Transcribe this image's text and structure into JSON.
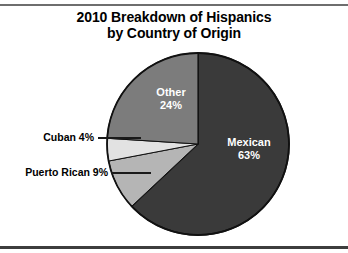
{
  "figure": {
    "title_line_1": "2010 Breakdown of Hispanics",
    "title_line_2": "by Country of Origin"
  },
  "chart_data": {
    "type": "pie",
    "title": "2010 Breakdown of Hispanics by Country of Origin",
    "xlabel": "",
    "ylabel": "",
    "legend_position": "none",
    "grid": false,
    "start_angle_deg": 0,
    "direction": "clockwise",
    "categories": [
      "Mexican",
      "Puerto Rican",
      "Cuban",
      "Other"
    ],
    "values": [
      63,
      9,
      4,
      24
    ],
    "unit": "%",
    "slices": [
      {
        "name": "Mexican",
        "label": "Mexican",
        "percent": 63,
        "percent_text": "63%",
        "color": "#3a3a3a",
        "label_placement": "inside",
        "label_color": "#ffffff"
      },
      {
        "name": "Puerto Rican",
        "label": "Puerto Rican 9%",
        "percent": 9,
        "percent_text": "9%",
        "color": "#b5b5b5",
        "label_placement": "outside-left",
        "label_color": "#000000"
      },
      {
        "name": "Cuban",
        "label": "Cuban 4%",
        "percent": 4,
        "percent_text": "4%",
        "color": "#e2e2e2",
        "label_placement": "outside-left",
        "label_color": "#000000"
      },
      {
        "name": "Other",
        "label": "Other",
        "percent": 24,
        "percent_text": "24%",
        "color": "#7c7c7c",
        "label_placement": "inside",
        "label_color": "#ffffff"
      }
    ],
    "colors": {
      "mexican": "#3a3a3a",
      "puerto_rican": "#b5b5b5",
      "cuban": "#e2e2e2",
      "other": "#7c7c7c",
      "outline": "#111111",
      "background": "#ffffff",
      "rule": "#4a4a4a"
    }
  },
  "labels": {
    "other_name": "Other",
    "other_percent": "24%",
    "mexican_name": "Mexican",
    "mexican_percent": "63%",
    "cuban": "Cuban 4%",
    "puerto_rican": "Puerto Rican 9%"
  }
}
